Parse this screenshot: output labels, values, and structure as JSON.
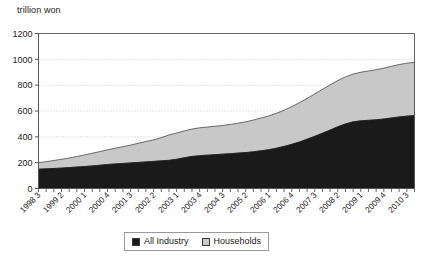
{
  "chart_data": {
    "type": "area",
    "stacked": true,
    "title": "",
    "subtitle": "",
    "xlabel": "",
    "ylabel": "trillion won",
    "ylim": [
      0,
      1200
    ],
    "ytick_values": [
      0,
      200,
      400,
      600,
      800,
      1000,
      1200
    ],
    "ytick_labels": [
      "0",
      "200",
      "400",
      "600",
      "800",
      "1000",
      "1200"
    ],
    "grid": true,
    "grid_style": "dotted-horizontal",
    "legend_position": "bottom-center",
    "legend": [
      "All Industry",
      "Households"
    ],
    "colors": {
      "all_industry": "#1a1a1a",
      "households": "#c8c8c8",
      "grid": "#bdbdbd",
      "axis": "#555555",
      "outline": "#333333"
    },
    "x_tick_labels": [
      "1998 3",
      "1999 2",
      "2000 1",
      "2000 4",
      "2001 3",
      "2002 2",
      "2003 1",
      "2003 4",
      "2004 3",
      "2005 2",
      "2006 1",
      "2006 4",
      "2007 3",
      "2008 2",
      "2009 1",
      "2009 4",
      "2010 3"
    ],
    "x_label_interval_quarters": 3,
    "x": [
      "1998 3",
      "1998 4",
      "1999 1",
      "1999 2",
      "1999 3",
      "1999 4",
      "2000 1",
      "2000 2",
      "2000 3",
      "2000 4",
      "2001 1",
      "2001 2",
      "2001 3",
      "2001 4",
      "2002 1",
      "2002 2",
      "2002 3",
      "2002 4",
      "2003 1",
      "2003 2",
      "2003 3",
      "2003 4",
      "2004 1",
      "2004 2",
      "2004 3",
      "2004 4",
      "2005 1",
      "2005 2",
      "2005 3",
      "2005 4",
      "2006 1",
      "2006 2",
      "2006 3",
      "2006 4",
      "2007 1",
      "2007 2",
      "2007 3",
      "2007 4",
      "2008 1",
      "2008 2",
      "2008 3",
      "2008 4",
      "2009 1",
      "2009 2",
      "2009 3",
      "2009 4",
      "2010 1",
      "2010 2",
      "2010 3",
      "2010 4"
    ],
    "series": [
      {
        "name": "All Industry",
        "color": "#1a1a1a",
        "values": [
          150,
          152,
          155,
          158,
          162,
          166,
          170,
          175,
          180,
          186,
          190,
          194,
          198,
          202,
          206,
          210,
          214,
          218,
          226,
          238,
          248,
          254,
          258,
          262,
          266,
          270,
          274,
          278,
          284,
          292,
          300,
          312,
          326,
          342,
          360,
          382,
          404,
          428,
          452,
          478,
          500,
          516,
          524,
          528,
          532,
          538,
          546,
          554,
          560,
          565
        ]
      },
      {
        "name": "Households",
        "color": "#c8c8c8",
        "values": [
          50,
          56,
          62,
          68,
          74,
          82,
          90,
          98,
          106,
          114,
          122,
          130,
          138,
          148,
          158,
          166,
          180,
          196,
          204,
          208,
          212,
          216,
          218,
          220,
          222,
          226,
          232,
          238,
          246,
          254,
          262,
          270,
          280,
          292,
          304,
          316,
          328,
          340,
          350,
          358,
          364,
          370,
          376,
          382,
          388,
          394,
          400,
          406,
          410,
          412
        ]
      }
    ],
    "totals_note": "stacked total reaches about 975 at the right edge"
  },
  "legend": {
    "items": [
      {
        "label": "All Industry",
        "color": "#1a1a1a"
      },
      {
        "label": "Households",
        "color": "#c8c8c8"
      }
    ]
  }
}
